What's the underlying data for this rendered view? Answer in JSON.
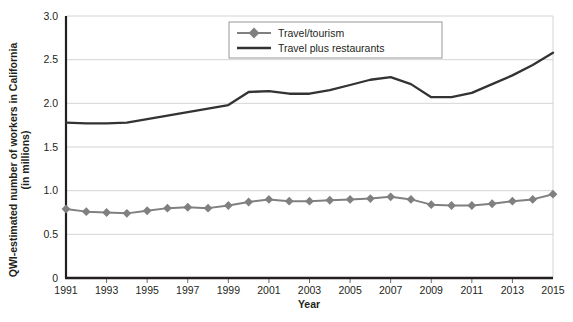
{
  "chart_data": {
    "type": "line",
    "title": "",
    "xlabel": "Year",
    "ylabel": "QWI-estimated number of workers in California (in millions)",
    "ylabel_line1": "QWI-estimated number of workers in California",
    "ylabel_line2": "(in millions)",
    "x": [
      1991,
      1992,
      1993,
      1994,
      1995,
      1996,
      1997,
      1998,
      1999,
      2000,
      2001,
      2002,
      2003,
      2004,
      2005,
      2006,
      2007,
      2008,
      2009,
      2010,
      2011,
      2012,
      2013,
      2014,
      2015
    ],
    "xlim": [
      1991,
      2015
    ],
    "ylim": [
      0,
      3.0
    ],
    "yticks": [
      0,
      0.5,
      1.0,
      1.5,
      2.0,
      2.5,
      3.0
    ],
    "ytick_labels": [
      "0",
      "0.5",
      "1.0",
      "1.5",
      "2.0",
      "2.5",
      "3.0"
    ],
    "xtick_labels": [
      "1991",
      "1993",
      "1995",
      "1997",
      "1999",
      "2001",
      "2003",
      "2005",
      "2007",
      "2009",
      "2011",
      "2013",
      "2015"
    ],
    "xticks_labeled": [
      1991,
      1993,
      1995,
      1997,
      1999,
      2001,
      2003,
      2005,
      2007,
      2009,
      2011,
      2013,
      2015
    ],
    "grid": true,
    "grid_axis": "y",
    "legend_position": "top-right",
    "series": [
      {
        "name": "Travel/tourism",
        "color": "#808080",
        "marker": "diamond",
        "values": [
          0.79,
          0.76,
          0.75,
          0.74,
          0.77,
          0.8,
          0.81,
          0.8,
          0.83,
          0.87,
          0.9,
          0.88,
          0.88,
          0.89,
          0.9,
          0.91,
          0.93,
          0.9,
          0.84,
          0.83,
          0.83,
          0.85,
          0.88,
          0.9,
          0.96
        ]
      },
      {
        "name": "Travel plus restaurants",
        "color": "#333333",
        "marker": "none",
        "values": [
          1.78,
          1.77,
          1.77,
          1.78,
          1.82,
          1.86,
          1.9,
          1.94,
          1.98,
          2.13,
          2.14,
          2.11,
          2.11,
          2.15,
          2.21,
          2.27,
          2.3,
          2.22,
          2.07,
          2.07,
          2.12,
          2.22,
          2.32,
          2.44,
          2.58
        ]
      }
    ]
  },
  "axes": {
    "x_title": "Year",
    "y_title_line1": "QWI-estimated number of workers in California",
    "y_title_line2": "(in millions)"
  },
  "legend": {
    "items": [
      {
        "label": "Travel/tourism",
        "color": "#808080",
        "marker": "diamond"
      },
      {
        "label": "Travel plus restaurants",
        "color": "#333333",
        "marker": "line"
      }
    ]
  },
  "colors": {
    "travel_tourism": "#808080",
    "travel_plus_restaurants": "#333333",
    "grid": "#c9c9c9",
    "axis": "#231f20",
    "background": "#ffffff"
  }
}
